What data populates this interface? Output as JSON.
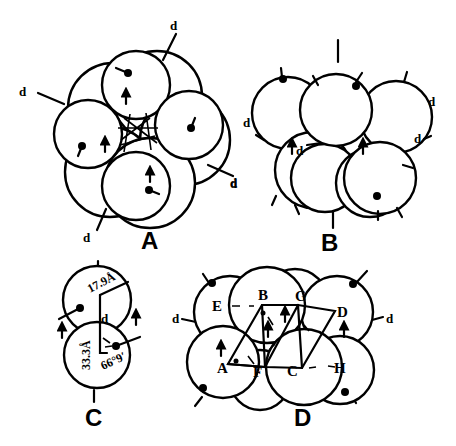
{
  "figure": {
    "panels": [
      {
        "id": "A",
        "label": "A",
        "d_label": "d"
      },
      {
        "id": "B",
        "label": "B",
        "d_label": "d"
      },
      {
        "id": "C",
        "label": "C",
        "d_label": "d",
        "measurements": {
          "radius": "17.9Å",
          "height": "33.3Å",
          "angle": "66°9′"
        }
      },
      {
        "id": "D",
        "label": "D",
        "d_label": "d",
        "point_labels": [
          "A",
          "B",
          "C",
          "D",
          "E",
          "F",
          "G",
          "H"
        ]
      }
    ]
  }
}
